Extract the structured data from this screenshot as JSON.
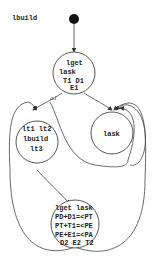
{
  "diagram": {
    "type": "state-graph",
    "start": {
      "label": "lbuild",
      "color": "#111111"
    },
    "nodes": [
      {
        "id": "n0",
        "lines": [
          "lget",
          "lask",
          "T1  D1",
          "E1"
        ]
      },
      {
        "id": "n1",
        "lines": [
          "lt1 lt2",
          "lbuild",
          "lt3"
        ]
      },
      {
        "id": "n2",
        "lines": [
          "lask"
        ]
      },
      {
        "id": "n3",
        "lines": [
          "lget lask",
          "PD+D1=<PT",
          "PT+T1=<PE",
          "PE+E1=<PA",
          "D2 E2 T2"
        ]
      }
    ],
    "edges": [
      {
        "from": "start",
        "to": "n0",
        "label": ""
      },
      {
        "from": "n0",
        "to": "n1",
        "label": "a1"
      },
      {
        "from": "n0",
        "to": "n2",
        "label": ""
      },
      {
        "from": "n1",
        "to": "n3",
        "label": ""
      },
      {
        "from": "n1",
        "to": "n2",
        "label": ""
      },
      {
        "from": "n2",
        "to": "n2",
        "label": ""
      },
      {
        "from": "n3",
        "to": "n1",
        "label": ""
      },
      {
        "from": "n3",
        "to": "n2",
        "label": ""
      }
    ]
  }
}
